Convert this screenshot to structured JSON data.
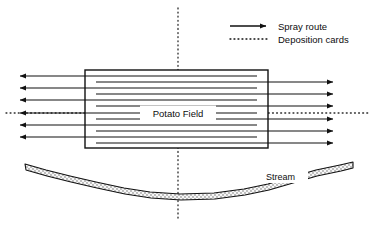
{
  "figure": {
    "title": "",
    "background_color": "#ffffff",
    "line_color": "#111111",
    "width": 376,
    "height": 225
  },
  "legend": {
    "position": "top-right",
    "items": [
      {
        "key": "spray-route",
        "label": "Spray route",
        "style": "solid-line-with-arrowhead",
        "color": "#111111"
      },
      {
        "key": "deposition-cards",
        "label": "Deposition cards",
        "style": "dotted-line",
        "color": "#111111"
      }
    ]
  },
  "field": {
    "label": "Potato Field",
    "shape": "rectangle",
    "x": 85,
    "y": 70,
    "width": 183,
    "height": 78,
    "border_color": "#111111",
    "fill": "#ffffff",
    "spray_pass_count": 12,
    "spray_passes": [
      {
        "index": 1,
        "y": 76,
        "direction": "left"
      },
      {
        "index": 2,
        "y": 82,
        "direction": "right"
      },
      {
        "index": 3,
        "y": 88,
        "direction": "left"
      },
      {
        "index": 4,
        "y": 94,
        "direction": "right"
      },
      {
        "index": 5,
        "y": 100,
        "direction": "left"
      },
      {
        "index": 6,
        "y": 106,
        "direction": "right"
      },
      {
        "index": 7,
        "y": 113,
        "direction": "left"
      },
      {
        "index": 8,
        "y": 119,
        "direction": "right"
      },
      {
        "index": 9,
        "y": 125,
        "direction": "left"
      },
      {
        "index": 10,
        "y": 131,
        "direction": "right"
      },
      {
        "index": 11,
        "y": 137,
        "direction": "left"
      },
      {
        "index": 12,
        "y": 143,
        "direction": "right"
      }
    ],
    "spray_overrun_left": 72,
    "spray_overrun_right": 72
  },
  "deposition_lines": {
    "vertical": {
      "label": "vertical deposition card transect",
      "x": 178,
      "y_top": 8,
      "y_bottom": 218,
      "style": "dotted"
    },
    "horizontal": {
      "label": "horizontal deposition card transect",
      "y": 113,
      "x_left": 6,
      "x_right": 370,
      "style": "dotted"
    }
  },
  "stream": {
    "label": "Stream",
    "label_x": 268,
    "label_y": 180,
    "fill_pattern": "stippled",
    "outline_color": "#111111",
    "band_top_path": "M 25,164 L 46,170 L 70,176 L 96,182 L 124,188 L 150,192 L 180,194 L 214,193 L 244,189 L 268,184 L 292,177 L 316,170 L 340,165 L 352,163",
    "band_bottom_path": "M 26,169 L 47,175 L 71,181 L 97,187 L 125,193 L 151,197 L 181,199 L 215,198 L 245,194 L 269,189 L 293,182 L 317,175 L 341,170 L 353,168"
  }
}
